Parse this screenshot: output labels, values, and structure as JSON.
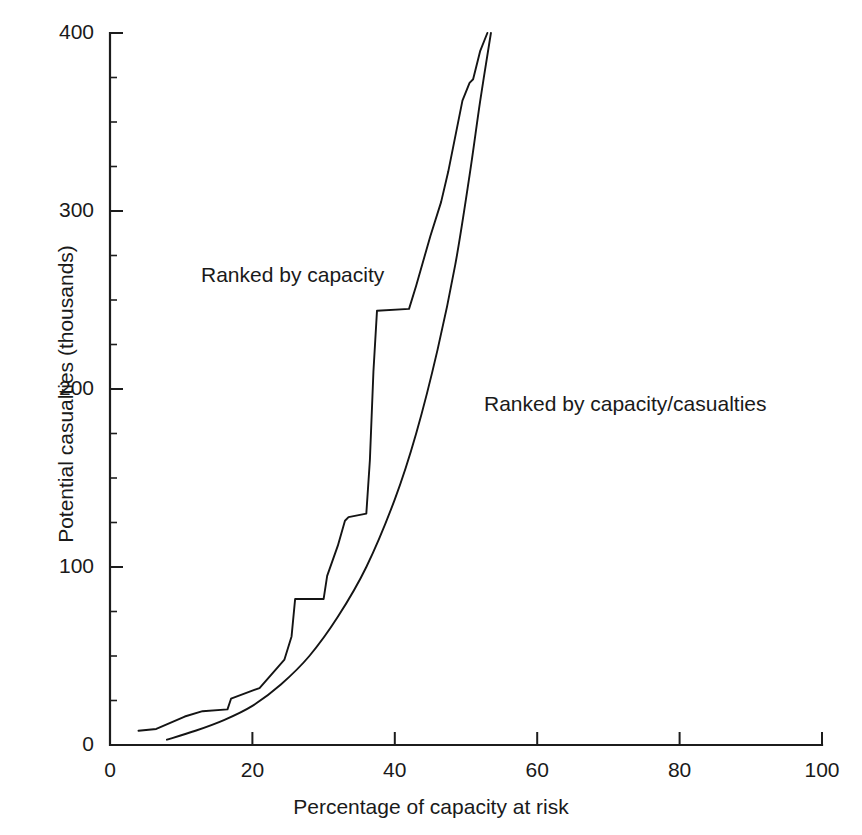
{
  "figure": {
    "caption_remnant": "",
    "background_color": "#ffffff",
    "ink_color": "#141414"
  },
  "chart_data": {
    "type": "line",
    "title": "",
    "xlabel": "Percentage of capacity at risk",
    "ylabel": "Potential casualties (thousands)",
    "xlim": [
      0,
      100
    ],
    "ylim": [
      0,
      400
    ],
    "grid": false,
    "legend_position": "inline-annotations",
    "x_ticks": [
      0,
      20,
      40,
      60,
      80,
      100
    ],
    "x_tick_labels": [
      "0",
      "20",
      "40",
      "60",
      "80",
      "100"
    ],
    "y_ticks": [
      0,
      100,
      200,
      300,
      400
    ],
    "y_tick_labels": [
      "0",
      "100",
      "200",
      "300",
      "400"
    ],
    "y_minor_ticks": [
      25,
      50,
      75,
      125,
      150,
      175,
      225,
      250,
      275,
      325,
      350,
      375
    ],
    "series": [
      {
        "name": "Ranked by capacity",
        "annotation_label": "Ranked by capacity",
        "style": "stepped",
        "points": [
          [
            4.0,
            8
          ],
          [
            6.5,
            9
          ],
          [
            10.5,
            16
          ],
          [
            13.0,
            19
          ],
          [
            16.5,
            20
          ],
          [
            17.0,
            26
          ],
          [
            21.0,
            32
          ],
          [
            24.5,
            48
          ],
          [
            25.5,
            61
          ],
          [
            26.0,
            82
          ],
          [
            30.0,
            82
          ],
          [
            30.5,
            95
          ],
          [
            32.0,
            112
          ],
          [
            33.0,
            126
          ],
          [
            33.5,
            128
          ],
          [
            36.0,
            130
          ],
          [
            36.5,
            160
          ],
          [
            37.0,
            210
          ],
          [
            37.5,
            244
          ],
          [
            42.0,
            245
          ],
          [
            43.0,
            258
          ],
          [
            45.0,
            286
          ],
          [
            46.5,
            305
          ],
          [
            47.5,
            322
          ],
          [
            49.5,
            362
          ],
          [
            50.5,
            372
          ],
          [
            51.0,
            374
          ],
          [
            52.0,
            390
          ],
          [
            53.0,
            400
          ]
        ]
      },
      {
        "name": "Ranked by capacity/casualties",
        "annotation_label": "Ranked by capacity/casualties",
        "style": "smooth",
        "points": [
          [
            8.0,
            3
          ],
          [
            12.0,
            8
          ],
          [
            16.0,
            14
          ],
          [
            20.0,
            22
          ],
          [
            24.0,
            34
          ],
          [
            28.0,
            50
          ],
          [
            32.0,
            72
          ],
          [
            36.0,
            100
          ],
          [
            40.0,
            138
          ],
          [
            43.0,
            175
          ],
          [
            46.0,
            222
          ],
          [
            48.5,
            270
          ],
          [
            50.5,
            320
          ],
          [
            52.0,
            362
          ],
          [
            53.5,
            400
          ]
        ]
      }
    ]
  }
}
